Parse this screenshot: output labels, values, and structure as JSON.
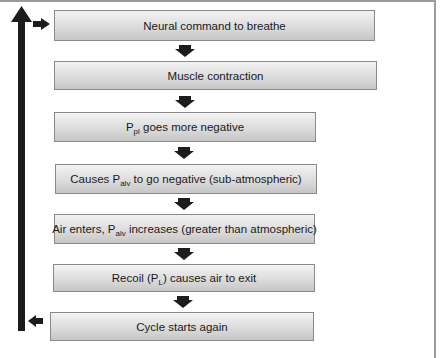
{
  "diagram": {
    "type": "flowchart",
    "steps": [
      {
        "pre": "Neural command to breathe",
        "sub": "",
        "post": ""
      },
      {
        "pre": "Muscle contraction",
        "sub": "",
        "post": ""
      },
      {
        "pre": "P",
        "sub": "pl",
        "post": " goes more negative"
      },
      {
        "pre": "Causes P",
        "sub": "alv",
        "post": " to go negative (sub-atmospheric)"
      },
      {
        "pre": "Air enters, P",
        "sub": "alv",
        "post": " increases (greater than atmospheric)"
      },
      {
        "pre": "Recoil (P",
        "sub": "L",
        "post": ") causes air to exit"
      },
      {
        "pre": "Cycle starts again",
        "sub": "",
        "post": ""
      }
    ],
    "connectors": [
      "down-arrow",
      "down-arrow",
      "down-arrow",
      "down-arrow",
      "down-arrow",
      "down-arrow"
    ],
    "loop": {
      "from_step": 7,
      "to_step": 1,
      "icon": "loop-back-arrow"
    },
    "colors": {
      "box_border": "#8a8a8a",
      "box_top": "#f3f3f3",
      "box_bottom": "#c6c6c6",
      "arrow": "#1c1c1c"
    },
    "caption": ""
  }
}
